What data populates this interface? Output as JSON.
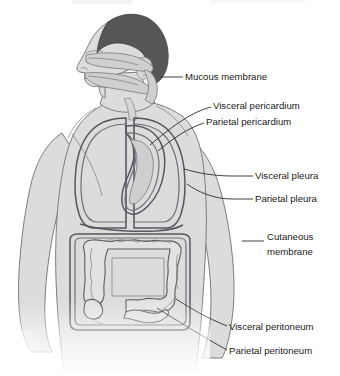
{
  "figure": {
    "background_color": "#ffffff",
    "body_fill_color": "#dcdcdc",
    "hair_color": "#565656",
    "membrane_line_color": "#55575e",
    "organ_fill_color": "#e2e2e2",
    "label_text_color": "#1a1a1a",
    "leader_line_color": "#2b2b2b"
  },
  "cropped_header": {
    "visible": true,
    "note": "faint cropped descenders of a caption line at the very top edge"
  },
  "labels": [
    {
      "id": "mucous-membrane",
      "text": "Mucous membrane",
      "lines": [
        "Mucous membrane"
      ],
      "text_x": 185,
      "text_y": 77,
      "anchor": "start",
      "leader": "M 175 77 L 162 77"
    },
    {
      "id": "visceral-pericardium",
      "text": "Visceral pericardium",
      "lines": [
        "Visceral pericardium"
      ],
      "text_x": 213,
      "text_y": 106,
      "anchor": "start",
      "leader": "M 210 107 C 190 112 168 132 150 146"
    },
    {
      "id": "parietal-pericardium",
      "text": "Parietal pericardium",
      "lines": [
        "Parietal pericardium"
      ],
      "text_x": 206,
      "text_y": 122,
      "anchor": "start",
      "leader": "M 203 123 C 186 128 170 140 156 152"
    },
    {
      "id": "visceral-pleura",
      "text": "Visceral pleura",
      "lines": [
        "Visceral pleura"
      ],
      "text_x": 255,
      "text_y": 176,
      "anchor": "start",
      "leader": "M 252 176 L 232 176 M 232 176 C 214 176 196 172 182 168"
    },
    {
      "id": "parietal-pleura",
      "text": "Parietal pleura",
      "lines": [
        "Parietal pleura"
      ],
      "text_x": 255,
      "text_y": 199,
      "anchor": "start",
      "leader": "M 252 199 L 232 199 M 232 199 C 214 199 198 192 186 184"
    },
    {
      "id": "cutaneous-membrane",
      "text": "Cutaneous membrane",
      "lines": [
        "Cutaneous",
        "membrane"
      ],
      "text_x": 267,
      "text_y": 240,
      "anchor": "start",
      "leader": "M 263 241 L 243 241"
    },
    {
      "id": "visceral-peritoneum",
      "text": "Visceral peritoneum",
      "lines": [
        "Visceral peritoneum"
      ],
      "text_x": 229,
      "text_y": 327,
      "anchor": "start",
      "leader": "M 226 326 C 206 318 190 308 176 300"
    },
    {
      "id": "parietal-peritoneum",
      "text": "Parietal peritoneum",
      "lines": [
        "Parietal peritoneum"
      ],
      "text_x": 229,
      "text_y": 351,
      "anchor": "start",
      "leader": "M 226 350 C 202 336 176 320 156 308"
    }
  ],
  "anatomy_parts": [
    {
      "id": "head-hair",
      "name": "hair"
    },
    {
      "id": "head-face",
      "name": "face-profile"
    },
    {
      "id": "nasal-oral-cavity",
      "name": "nasal-and-oral-cavity-mucosa"
    },
    {
      "id": "neck",
      "name": "neck"
    },
    {
      "id": "torso",
      "name": "torso"
    },
    {
      "id": "left-arm",
      "name": "left-arm"
    },
    {
      "id": "right-arm",
      "name": "right-arm"
    },
    {
      "id": "lung-left",
      "name": "left-lung-pleural-sac"
    },
    {
      "id": "lung-right",
      "name": "right-lung-pleural-sac"
    },
    {
      "id": "heart-pericardial-sac",
      "name": "heart-pericardial-sac"
    },
    {
      "id": "large-intestine",
      "name": "large-intestine-colon"
    },
    {
      "id": "peritoneal-cavity",
      "name": "peritoneal-cavity"
    }
  ]
}
